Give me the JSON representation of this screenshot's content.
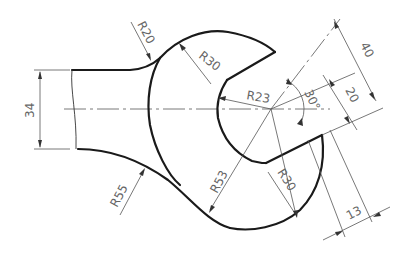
{
  "drawing": {
    "type": "engineering-drawing",
    "subject": "wrench head",
    "colors": {
      "outline": "#1a1a1a",
      "dimension": "#555555",
      "text": "#666666",
      "background": "#ffffff"
    },
    "dimensions": {
      "handle_width": "34",
      "fillet_top": "R20",
      "head_upper_arc": "R30",
      "jaw_radius": "R23",
      "jaw_angle": "30°",
      "jaw_width": "20",
      "jaw_outer_width": "40",
      "head_outer_arc": "R53",
      "head_lower_arc": "R30",
      "fillet_bottom": "R55",
      "jaw_offset": "13"
    }
  }
}
